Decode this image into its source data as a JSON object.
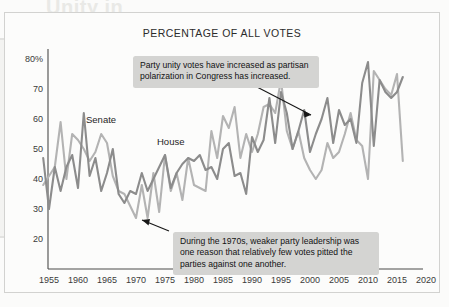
{
  "background_bleed": {
    "title_line": "Unity in",
    "heading_line": "Congress Party Unity Scores",
    "sub_line_1": "Party unity scores measure the frequency",
    "sub_line_2": "with which members vote with their party."
  },
  "panel": {
    "title": "PERCENTAGE OF ALL VOTES"
  },
  "annotations": {
    "top": "Party unity votes have increased as partisan polarization in Congress has increased.",
    "bottom": "During the 1970s, weaker party leadership was one reason that relatively few votes pitted the parties against one another."
  },
  "axis": {
    "y_ticks": [
      "80%",
      "70",
      "60",
      "50",
      "40",
      "30",
      "20"
    ],
    "x_ticks": [
      "1955",
      "1960",
      "1965",
      "1970",
      "1975",
      "1980",
      "1985",
      "1990",
      "1995",
      "2000",
      "2005",
      "2010",
      "2015",
      "2020"
    ]
  },
  "series_labels": {
    "senate": "Senate",
    "house": "House"
  },
  "colors": {
    "senate_line": "#8c8c8c",
    "house_line": "#b3b3b3",
    "axis": "#4a4a4a",
    "callout_bg": "#d4d4d2",
    "panel_bg": "#fcfcfb"
  },
  "chart_data": {
    "type": "line",
    "title": "PERCENTAGE OF ALL VOTES",
    "xlabel": "",
    "ylabel": "",
    "xlim": [
      1953,
      2020
    ],
    "ylim": [
      15,
      85
    ],
    "grid": false,
    "legend": "inline-labels",
    "y_tick_values": [
      20,
      30,
      40,
      50,
      60,
      70,
      80
    ],
    "x_tick_values": [
      1955,
      1960,
      1965,
      1970,
      1975,
      1980,
      1985,
      1990,
      1995,
      2000,
      2005,
      2010,
      2015,
      2020
    ],
    "series": [
      {
        "name": "Senate",
        "color": "#8c8c8c",
        "x": [
          1954,
          1955,
          1956,
          1957,
          1958,
          1959,
          1960,
          1961,
          1962,
          1963,
          1964,
          1965,
          1966,
          1967,
          1968,
          1969,
          1970,
          1971,
          1972,
          1973,
          1974,
          1975,
          1976,
          1977,
          1978,
          1979,
          1980,
          1981,
          1982,
          1983,
          1984,
          1985,
          1986,
          1987,
          1988,
          1989,
          1990,
          1991,
          1992,
          1993,
          1994,
          1995,
          1996,
          1997,
          1998,
          1999,
          2000,
          2001,
          2002,
          2003,
          2004,
          2005,
          2006,
          2007,
          2008,
          2009,
          2010,
          2011,
          2012,
          2013,
          2014,
          2015,
          2016
        ],
        "y": [
          47,
          30,
          44,
          36,
          44,
          48,
          37,
          62,
          41,
          47,
          36,
          42,
          50,
          35,
          32,
          36,
          35,
          42,
          36,
          40,
          44,
          48,
          37,
          42,
          45,
          47,
          46,
          48,
          43,
          44,
          40,
          50,
          52,
          41,
          42,
          35,
          54,
          49,
          53,
          67,
          52,
          69,
          62,
          50,
          56,
          63,
          49,
          55,
          60,
          67,
          52,
          63,
          58,
          60,
          52,
          72,
          79,
          51,
          73,
          69,
          67,
          69,
          74
        ],
        "note": "Percentage of Senate roll-call votes that were party unity votes"
      },
      {
        "name": "House",
        "color": "#b3b3b3",
        "x": [
          1954,
          1955,
          1956,
          1957,
          1958,
          1959,
          1960,
          1961,
          1962,
          1963,
          1964,
          1965,
          1966,
          1967,
          1968,
          1969,
          1970,
          1971,
          1972,
          1973,
          1974,
          1975,
          1976,
          1977,
          1978,
          1979,
          1980,
          1981,
          1982,
          1983,
          1984,
          1985,
          1986,
          1987,
          1988,
          1989,
          1990,
          1991,
          1992,
          1993,
          1994,
          1995,
          1996,
          1997,
          1998,
          1999,
          2000,
          2001,
          2002,
          2003,
          2004,
          2005,
          2006,
          2007,
          2008,
          2009,
          2010,
          2011,
          2012,
          2013,
          2014,
          2015,
          2016
        ],
        "y": [
          38,
          41,
          44,
          59,
          40,
          55,
          53,
          50,
          46,
          49,
          55,
          52,
          41,
          36,
          35,
          31,
          27,
          38,
          27,
          42,
          29,
          48,
          36,
          42,
          33,
          47,
          38,
          37,
          36,
          56,
          47,
          61,
          57,
          64,
          47,
          55,
          49,
          55,
          64,
          65,
          62,
          73,
          56,
          50,
          56,
          47,
          43,
          40,
          43,
          52,
          47,
          49,
          55,
          62,
          53,
          51,
          40,
          76,
          73,
          70,
          68,
          75,
          46
        ],
        "note": "Percentage of House roll-call votes that were party unity votes"
      }
    ],
    "annotations": [
      {
        "text": "Party unity votes have increased as partisan polarization in Congress has increased.",
        "points_to_year": 2003,
        "points_to_value": 64
      },
      {
        "text": "During the 1970s, weaker party leadership was one reason that relatively few votes pitted the parties against one another.",
        "points_to_year": 1972,
        "points_to_value": 27
      }
    ]
  }
}
